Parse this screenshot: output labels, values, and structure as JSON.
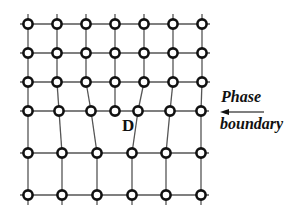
{
  "figure": {
    "type": "crystal lattice with edge dislocation at phase boundary",
    "dislocation_label": "D",
    "boundary_label_line1": "Phase",
    "boundary_label_line2": "boundary",
    "colors": {
      "line": "#555555",
      "atom_stroke": "#111111",
      "atom_fill": "#ffffff",
      "text": "#111111"
    }
  },
  "lattice": {
    "rows": [
      {
        "y": 24,
        "x": [
          28,
          57,
          86,
          115,
          144,
          173,
          202
        ]
      },
      {
        "y": 53,
        "x": [
          28,
          57,
          86,
          115,
          144,
          173,
          202
        ]
      },
      {
        "y": 82,
        "x": [
          28,
          57,
          86,
          115,
          144,
          173,
          202
        ]
      },
      {
        "y": 111,
        "x": [
          28,
          59,
          91,
          115,
          138,
          170,
          201
        ]
      },
      {
        "y": 153,
        "x": [
          28,
          62,
          97,
          132,
          166,
          201
        ]
      },
      {
        "y": 195,
        "x": [
          28,
          62,
          97,
          132,
          166,
          201
        ]
      }
    ]
  }
}
